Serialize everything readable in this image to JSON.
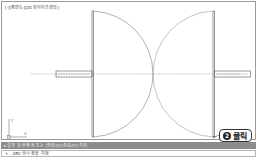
{
  "viewport": {
    "label": "[-][평면도][2D 와이어프레임]"
  },
  "drawing": {
    "type": "double-door-plan",
    "line_color": "#555555",
    "arc_color": "#777777"
  },
  "ucs_icon": {
    "x_label": "X",
    "y_label": "Y"
  },
  "callout": {
    "step_number": "2",
    "text": "클릭"
  },
  "command_line": {
    "history": "▸ 결과 첫 번째 점 또는 [명령(U)/종료(E)] 지정:",
    "close_icon": "✕",
    "prompt": "ARC 하나 점을 지정"
  },
  "colors": {
    "history_bg": "#8c8c8c",
    "border": "#9a9a9a"
  }
}
